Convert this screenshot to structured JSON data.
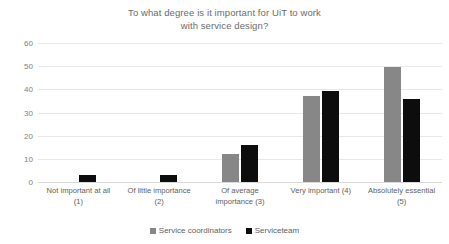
{
  "chart_data": {
    "type": "bar",
    "title": "To what degree is it important for UiT to work with service design?",
    "title_lines": [
      "To what degree is it important for UiT to work",
      "with service design?"
    ],
    "xlabel": "",
    "ylabel": "",
    "ylim": [
      0,
      60
    ],
    "ytick_step": 10,
    "yticks": [
      0,
      10,
      20,
      30,
      40,
      50,
      60
    ],
    "ytick_labels": [
      "0",
      "10",
      "20",
      "30",
      "40",
      "50",
      "60"
    ],
    "grid": true,
    "legend_position": "bottom",
    "categories": [
      "Not important at all (1)",
      "Of little importance (2)",
      "Of average importance (3)",
      "Very important (4)",
      "Absolutely essential (5)"
    ],
    "category_lines": [
      [
        "Not important at all",
        "(1)"
      ],
      [
        "Of little importance",
        "(2)"
      ],
      [
        "Of average",
        "importance (3)"
      ],
      [
        "Very important (4)",
        ""
      ],
      [
        "Absolutely essential",
        "(5)"
      ]
    ],
    "series": [
      {
        "name": "Service coordinators",
        "color": "#878787",
        "values": [
          0,
          0,
          12,
          37,
          49.5
        ]
      },
      {
        "name": "Serviceteam",
        "color": "#0d0d0d",
        "values": [
          3,
          3,
          16,
          39.5,
          36
        ]
      }
    ]
  },
  "legend": {
    "items": [
      {
        "label": "Service coordinators",
        "swatch": "series-a"
      },
      {
        "label": "Serviceteam",
        "swatch": "series-b"
      }
    ]
  }
}
